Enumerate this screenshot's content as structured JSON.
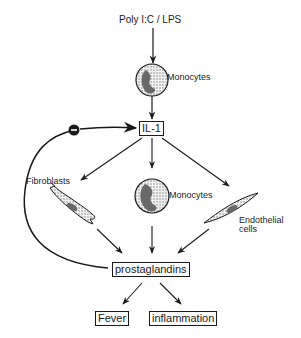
{
  "diagram": {
    "stimulus": "Poly I:C / LPS",
    "top_cell_label": "Monocytes",
    "cytokine": "IL-1",
    "inhibition_symbol": "−",
    "targets": {
      "fibroblasts": "Fibroblasts",
      "monocytes": "Monocytes",
      "endothelial_line1": "Endothelial",
      "endothelial_line2": "cells"
    },
    "mediator": "prostaglandins",
    "outcomes": {
      "fever": "Fever",
      "inflammation": "inflammation"
    }
  },
  "colors": {
    "ink": "#1a1a1a",
    "cell_fill": "#d9d9d9",
    "nucleus_fill": "#555555",
    "background": "#ffffff"
  }
}
